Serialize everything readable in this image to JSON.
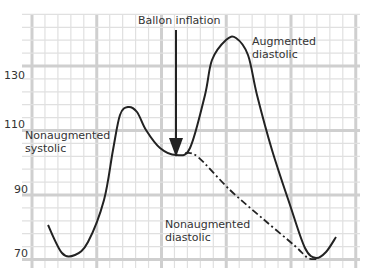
{
  "chart_data": {
    "type": "line",
    "title": "",
    "xlabel": "",
    "ylabel": "",
    "ylim": [
      65,
      145
    ],
    "y_ticks": [
      "130",
      "110",
      "90",
      "70"
    ],
    "grid": true,
    "series": [
      {
        "name": "Augmented waveform",
        "style": "solid",
        "points": [
          [
            48,
            225
          ],
          [
            62,
            253
          ],
          [
            75,
            255
          ],
          [
            88,
            242
          ],
          [
            104,
            200
          ],
          [
            113,
            150
          ],
          [
            120,
            115
          ],
          [
            128,
            107
          ],
          [
            137,
            112
          ],
          [
            146,
            130
          ],
          [
            160,
            148
          ],
          [
            176,
            155
          ],
          [
            190,
            148
          ],
          [
            205,
            95
          ],
          [
            212,
            60
          ],
          [
            226,
            40
          ],
          [
            236,
            38
          ],
          [
            248,
            55
          ],
          [
            257,
            95
          ],
          [
            272,
            150
          ],
          [
            290,
            205
          ],
          [
            305,
            248
          ],
          [
            316,
            258
          ],
          [
            326,
            252
          ],
          [
            336,
            237
          ]
        ]
      },
      {
        "name": "Nonaugmented diastolic",
        "style": "dash-dot",
        "points": [
          [
            185,
            153
          ],
          [
            198,
            157
          ],
          [
            230,
            190
          ],
          [
            262,
            218
          ],
          [
            295,
            246
          ],
          [
            308,
            258
          ],
          [
            318,
            259
          ]
        ]
      }
    ],
    "annotations": {
      "balloon": "Ballon inflation",
      "aug_diastolic_1": "Augmented",
      "aug_diastolic_2": "diastolic",
      "nonaug_systolic_1": "Nonaugmented",
      "nonaug_systolic_2": "systolic",
      "nonaug_diastolic_1": "Nonaugmented",
      "nonaug_diastolic_2": "diastolic"
    }
  }
}
